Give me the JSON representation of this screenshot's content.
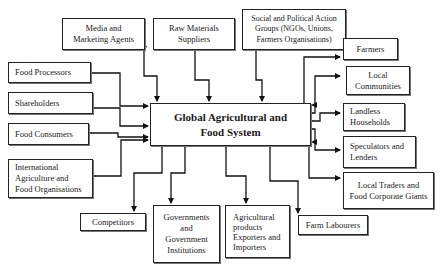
{
  "diagram": {
    "center": {
      "line1": "Global Agricultural  and",
      "line2": "Food System"
    },
    "top": [
      {
        "id": "media",
        "lines": [
          "Media and",
          "Marketing Agents"
        ]
      },
      {
        "id": "raw-materials",
        "lines": [
          "Raw Materials",
          "Suppliers"
        ]
      },
      {
        "id": "social",
        "lines": [
          "Social and Political Action",
          "Groups (NGOs, Unions,",
          "Farmers Organisations)"
        ]
      }
    ],
    "left": [
      {
        "id": "food-processors",
        "lines": [
          "Food Processors"
        ]
      },
      {
        "id": "shareholders",
        "lines": [
          "Shareholders"
        ]
      },
      {
        "id": "food-consumers",
        "lines": [
          "Food Consumers"
        ]
      },
      {
        "id": "international",
        "lines": [
          "International",
          "Agriculture and",
          "Food Organisations"
        ]
      }
    ],
    "right": [
      {
        "id": "farmers",
        "lines": [
          "Farmers"
        ]
      },
      {
        "id": "local-communities",
        "lines": [
          "Local",
          "Communities"
        ]
      },
      {
        "id": "landless",
        "lines": [
          "Landless",
          "Households"
        ]
      },
      {
        "id": "speculators",
        "lines": [
          "Speculators and",
          "Lenders"
        ]
      },
      {
        "id": "local-traders",
        "lines": [
          "Local Traders and",
          "Food Corporate Giants"
        ]
      }
    ],
    "bottom": [
      {
        "id": "competitors",
        "lines": [
          "Competitors"
        ]
      },
      {
        "id": "governments",
        "lines": [
          "Governments",
          "and",
          "Government",
          "Institutions"
        ]
      },
      {
        "id": "agri-exporters",
        "lines": [
          "Agricultural",
          "products",
          "Exporters and",
          "Importers"
        ]
      },
      {
        "id": "farm-labourers",
        "lines": [
          "Farm Labourers"
        ]
      }
    ]
  },
  "colors": {
    "line": "#111111",
    "border": "#222222",
    "background": "#ffffff"
  }
}
